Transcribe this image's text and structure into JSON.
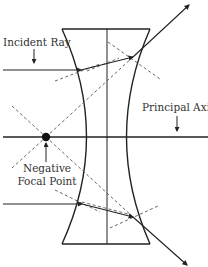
{
  "diagram": {
    "labels": {
      "incident_ray": "Incident Ray",
      "principal_axis": "Principal Axis",
      "focal_line1": "Negative",
      "focal_line2": "Focal Point"
    },
    "colors": {
      "line": "#222222",
      "dashed": "#555555",
      "text": "#333333",
      "background": "#ffffff"
    },
    "elements": [
      "concave lens",
      "principal axis",
      "lens center line",
      "negative focal point",
      "upper incident ray",
      "lower incident ray",
      "refracted rays",
      "normal lines (dashed)",
      "virtual extensions (dashed)"
    ]
  }
}
